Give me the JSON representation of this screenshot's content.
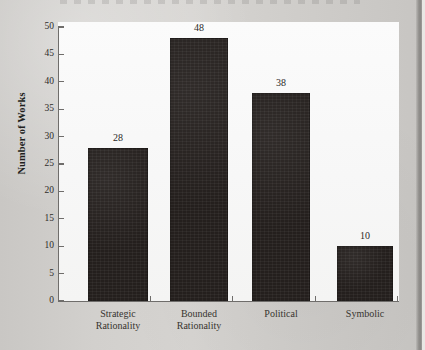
{
  "chart_data": {
    "type": "bar",
    "title": "",
    "xlabel": "",
    "ylabel": "Number of Works",
    "categories": [
      "Strategic Rationality",
      "Bounded Rationality",
      "Political",
      "Symbolic"
    ],
    "category_lines": [
      [
        "Strategic",
        "Rationality"
      ],
      [
        "Bounded",
        "Rationality"
      ],
      [
        "Political",
        ""
      ],
      [
        "Symbolic",
        ""
      ]
    ],
    "values": [
      28,
      48,
      38,
      10
    ],
    "value_labels": [
      "28",
      "48",
      "38",
      "10"
    ],
    "ylim": [
      0,
      50
    ],
    "ytick_labels": [
      "0",
      "5",
      "10",
      "15",
      "20",
      "25",
      "30",
      "35",
      "40",
      "45",
      "50"
    ],
    "ytick_values": [
      0,
      5,
      10,
      15,
      20,
      25,
      30,
      35,
      40,
      45,
      50
    ],
    "grid": false,
    "legend": false,
    "bar_color": "#241f1d",
    "axis_color": "#6f6d6b",
    "plot_background": "#f8f8f8",
    "page_background": "#cfcdca"
  }
}
